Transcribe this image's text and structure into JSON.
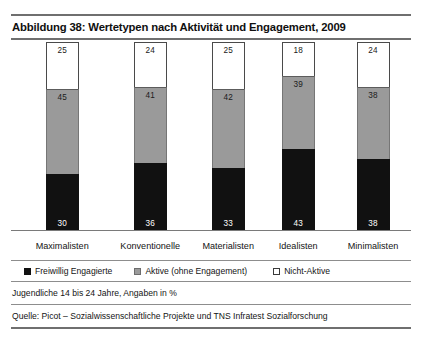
{
  "figure": {
    "title": "Abbildung 38: Wertetypen nach Aktivität und Engagement, 2009",
    "note": "Jugendliche 14 bis 24 Jahre, Angaben in %",
    "source": "Quelle: Picot – Sozialwissenschaftliche Projekte und TNS Infratest Sozialforschung"
  },
  "legend": {
    "items": [
      {
        "label": "Freiwillig Engagierte",
        "color": "#111111",
        "swatch": "black-square-icon"
      },
      {
        "label": "Aktive (ohne Engagement)",
        "color": "#9a9a9a",
        "swatch": "gray-square-icon"
      },
      {
        "label": "Nicht-Aktive",
        "color": "#ffffff",
        "swatch": "white-square-icon"
      }
    ]
  },
  "chart_data": {
    "type": "bar",
    "subtype": "stacked-100-percent",
    "title": "Abbildung 38: Wertetypen nach Aktivität und Engagement, 2009",
    "xlabel": "",
    "ylabel": "",
    "ylim": [
      0,
      100
    ],
    "grid": false,
    "legend_position": "bottom-left",
    "categories": [
      "Maximalisten",
      "Konventionelle",
      "Materialisten",
      "Idealisten",
      "Minimalisten"
    ],
    "series": [
      {
        "name": "Freiwillig Engagierte",
        "color": "#111111",
        "values": [
          30,
          36,
          33,
          43,
          38
        ]
      },
      {
        "name": "Aktive (ohne Engagement)",
        "color": "#9a9a9a",
        "values": [
          45,
          41,
          42,
          39,
          38
        ]
      },
      {
        "name": "Nicht-Aktive",
        "color": "#ffffff",
        "values": [
          25,
          24,
          25,
          18,
          24
        ]
      }
    ],
    "bars": [
      {
        "category": "Maximalisten",
        "center_pct": 12.8,
        "engagierte": 30,
        "aktive": 45,
        "nicht_aktive": 25
      },
      {
        "category": "Konventionelle",
        "center_pct": 34.8,
        "engagierte": 36,
        "aktive": 41,
        "nicht_aktive": 24
      },
      {
        "category": "Materialisten",
        "center_pct": 54.3,
        "engagierte": 33,
        "aktive": 42,
        "nicht_aktive": 25
      },
      {
        "category": "Idealisten",
        "center_pct": 71.8,
        "engagierte": 43,
        "aktive": 39,
        "nicht_aktive": 18
      },
      {
        "category": "Minimalisten",
        "center_pct": 90.5,
        "engagierte": 38,
        "aktive": 38,
        "nicht_aktive": 24
      }
    ]
  },
  "colors": {
    "black": "#111111",
    "gray": "#9a9a9a",
    "white": "#ffffff",
    "rule": "#6f6f6f"
  }
}
